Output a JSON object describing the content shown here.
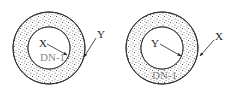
{
  "figures": [
    {
      "id": "left",
      "cx": 49,
      "cy": 48,
      "outer_r": 36,
      "inner_r": 21,
      "inner_label": "X",
      "outer_label": "Y",
      "bottom_text": "DN-1"
    },
    {
      "id": "right",
      "cx": 162,
      "cy": 48,
      "outer_r": 36,
      "inner_r": 21,
      "inner_label": "Y",
      "outer_label": "X",
      "bottom_text": "DN-1"
    }
  ],
  "colors": {
    "stroke": "#333333",
    "stipple": "#555555",
    "background": "#ffffff"
  }
}
